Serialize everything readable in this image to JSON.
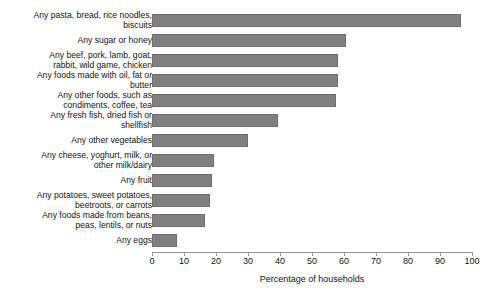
{
  "chart_data": {
    "type": "bar",
    "orientation": "horizontal",
    "title": "",
    "xlabel": "Percentage of households",
    "ylabel": "",
    "xlim": [
      0,
      100
    ],
    "xticks": [
      0,
      10,
      20,
      30,
      40,
      50,
      60,
      70,
      80,
      90,
      100
    ],
    "grid": false,
    "legend": null,
    "bar_color": "#808080",
    "bar_edge_color": "#6e6e6e",
    "categories": [
      "Any pasta, bread, rice noodles,\nbiscuits",
      "Any sugar or honey",
      "Any beef, pork, lamb, goat,\nrabbit, wild game, chicken",
      "Any foods made with oil, fat or\nbutter",
      "Any other foods, such as\ncondiments, coffee, tea",
      "Any fresh fish, dried fish or\nshellfish",
      "Any other vegetables",
      "Any cheese, yoghurt, milk, or\nother milk/dairy",
      "Any fruit",
      "Any potatoes, sweet potatoes,\nbeetroots, or carrots",
      "Any foods made from beans,\npeas, lentils, or nuts",
      "Any eggs"
    ],
    "values": [
      96.5,
      60.5,
      58,
      58,
      57.5,
      39.5,
      30,
      19.5,
      18.7,
      18,
      16.5,
      7.8
    ]
  }
}
